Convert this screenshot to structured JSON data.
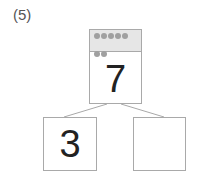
{
  "problem": {
    "label": "(5)"
  },
  "tree": {
    "whole": {
      "value": "7",
      "dots": 7
    },
    "parts": [
      {
        "value": "3"
      },
      {
        "value": ""
      }
    ]
  },
  "colors": {
    "line": "#a9a9a9",
    "band": "#e6e6e6",
    "dot": "#a0a0a0"
  }
}
